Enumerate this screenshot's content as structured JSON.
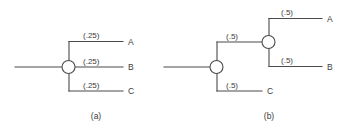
{
  "figure": {
    "background_color": "#ffffff",
    "line_color": "#4a4a4a",
    "text_color": "#3a3a3a"
  },
  "panels": [
    {
      "id": "a",
      "caption": "(a)",
      "node_count": 1,
      "probabilities": [
        "(.25)",
        "(.25)",
        "(.25)"
      ],
      "endpoints": [
        "A",
        "B",
        "C"
      ]
    },
    {
      "id": "b",
      "caption": "(b)",
      "node_count": 2,
      "probabilities": [
        "(.5)",
        "(.5)",
        "(.5)",
        "(.5)"
      ],
      "endpoints": [
        "A",
        "B",
        "C"
      ]
    }
  ],
  "panel_a": {
    "caption": "(a)",
    "prob_top": "(.25)",
    "prob_mid": "(.25)",
    "prob_bot": "(.25)",
    "endpoint_top": "A",
    "endpoint_mid": "B",
    "endpoint_bot": "C"
  },
  "panel_b": {
    "caption": "(b)",
    "prob_upper_branch": "(.5)",
    "prob_lower_branch": "(.5)",
    "prob_sub_top": "(.5)",
    "prob_sub_bot": "(.5)",
    "endpoint_top": "A",
    "endpoint_mid": "B",
    "endpoint_bot": "C"
  }
}
